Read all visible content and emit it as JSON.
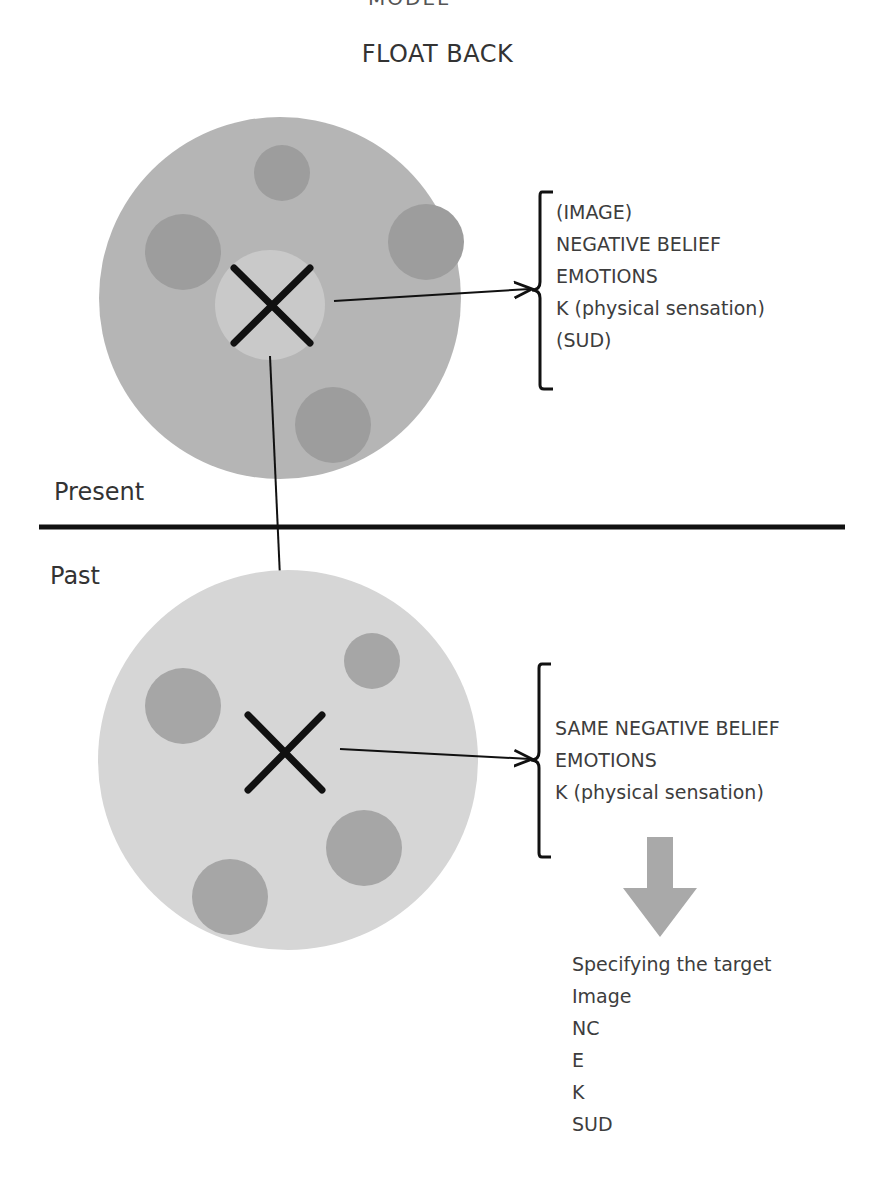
{
  "header": {
    "clipped_title": "MODEL",
    "title": "FLOAT BACK"
  },
  "present": {
    "label": "Present",
    "list_items": [
      "(IMAGE)",
      "NEGATIVE BELIEF",
      "EMOTIONS",
      "K (physical sensation)",
      "(SUD)"
    ]
  },
  "past": {
    "label": "Past",
    "list_items": [
      "SAME NEGATIVE BELIEF",
      "EMOTIONS",
      "K (physical sensation)"
    ]
  },
  "target": {
    "heading": "Specifying the target",
    "items": [
      "Image",
      "NC",
      "E",
      "K",
      "SUD"
    ]
  },
  "colors": {
    "present_circle": "#b5b5b5",
    "past_circle": "#d6d6d6",
    "inner_dots": "#999999",
    "arrow": "#a9a9a9",
    "line": "#111111"
  }
}
